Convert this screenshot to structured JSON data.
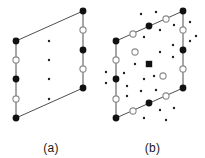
{
  "figure": {
    "type": "lattice-diagram",
    "background_color": "#ffffff",
    "line_color": "#3a3a3a",
    "filled_marker_color": "#111111",
    "open_marker_stroke": "#8a8a8a",
    "small_dot_color": "#222222",
    "width": 205,
    "height": 158
  },
  "panels": [
    {
      "id": "a",
      "caption": "(a)",
      "cell": {
        "corners": [
          {
            "x": 16,
            "y": 118,
            "marker": "filled-circle"
          },
          {
            "x": 16,
            "y": 41,
            "marker": "filled-circle"
          },
          {
            "x": 83,
            "y": 11,
            "marker": "filled-circle"
          },
          {
            "x": 83,
            "y": 88,
            "marker": "filled-circle"
          }
        ]
      },
      "markers": [
        {
          "x": 16,
          "y": 41,
          "type": "filled-circle",
          "r": 3.4
        },
        {
          "x": 16,
          "y": 60,
          "type": "open-circle",
          "r": 3.1
        },
        {
          "x": 16,
          "y": 79,
          "type": "filled-circle",
          "r": 3.4
        },
        {
          "x": 16,
          "y": 99,
          "type": "open-circle",
          "r": 3.1
        },
        {
          "x": 16,
          "y": 118,
          "type": "filled-circle",
          "r": 3.4
        },
        {
          "x": 83,
          "y": 11,
          "type": "filled-circle",
          "r": 3.4
        },
        {
          "x": 83,
          "y": 30,
          "type": "open-circle",
          "r": 3.1
        },
        {
          "x": 83,
          "y": 50,
          "type": "filled-circle",
          "r": 3.4
        },
        {
          "x": 83,
          "y": 69,
          "type": "open-circle",
          "r": 3.1
        },
        {
          "x": 83,
          "y": 88,
          "type": "filled-circle",
          "r": 3.4
        },
        {
          "x": 49,
          "y": 41,
          "type": "small-dot",
          "r": 1.2
        },
        {
          "x": 49,
          "y": 60,
          "type": "small-dot",
          "r": 1.2
        },
        {
          "x": 49,
          "y": 79,
          "type": "small-dot",
          "r": 1.2
        },
        {
          "x": 49,
          "y": 99,
          "type": "small-dot",
          "r": 1.2
        }
      ]
    },
    {
      "id": "b",
      "caption": "(b)",
      "cell": {
        "corners": [
          {
            "x": 16,
            "y": 118,
            "marker": "filled-circle"
          },
          {
            "x": 16,
            "y": 41,
            "marker": "filled-circle"
          },
          {
            "x": 83,
            "y": 11,
            "marker": "filled-circle"
          },
          {
            "x": 83,
            "y": 88,
            "marker": "filled-circle"
          }
        ]
      },
      "markers": [
        {
          "x": 16,
          "y": 41,
          "type": "filled-circle",
          "r": 3.4
        },
        {
          "x": 16,
          "y": 60,
          "type": "open-circle",
          "r": 3.1
        },
        {
          "x": 16,
          "y": 79,
          "type": "filled-circle",
          "r": 3.4
        },
        {
          "x": 16,
          "y": 99,
          "type": "open-circle",
          "r": 3.1
        },
        {
          "x": 16,
          "y": 118,
          "type": "filled-circle",
          "r": 3.4
        },
        {
          "x": 83,
          "y": 11,
          "type": "filled-circle",
          "r": 3.4
        },
        {
          "x": 83,
          "y": 30,
          "type": "open-circle",
          "r": 3.1
        },
        {
          "x": 83,
          "y": 50,
          "type": "filled-circle",
          "r": 3.4
        },
        {
          "x": 83,
          "y": 69,
          "type": "open-circle",
          "r": 3.1
        },
        {
          "x": 83,
          "y": 88,
          "type": "filled-circle",
          "r": 3.4
        },
        {
          "x": 33,
          "y": 34,
          "type": "open-circle",
          "r": 3.1
        },
        {
          "x": 49,
          "y": 26,
          "type": "filled-circle",
          "r": 3.4
        },
        {
          "x": 66,
          "y": 19,
          "type": "open-circle",
          "r": 3.1
        },
        {
          "x": 33,
          "y": 111,
          "type": "open-circle",
          "r": 3.1
        },
        {
          "x": 49,
          "y": 103,
          "type": "filled-circle",
          "r": 3.4
        },
        {
          "x": 66,
          "y": 96,
          "type": "open-circle",
          "r": 3.1
        },
        {
          "x": 49,
          "y": 64,
          "type": "filled-square",
          "r": 3.2
        },
        {
          "x": 35,
          "y": 52,
          "type": "open-circle",
          "r": 3.1
        },
        {
          "x": 63,
          "y": 76,
          "type": "open-circle",
          "r": 3.1
        },
        {
          "x": 41,
          "y": 14,
          "type": "small-dot",
          "r": 1.2
        },
        {
          "x": 56,
          "y": 12,
          "type": "small-dot",
          "r": 1.2
        },
        {
          "x": 60,
          "y": 30,
          "type": "small-dot",
          "r": 1.2
        },
        {
          "x": 44,
          "y": 37,
          "type": "small-dot",
          "r": 1.2
        },
        {
          "x": 74,
          "y": 25,
          "type": "small-dot",
          "r": 1.2
        },
        {
          "x": 90,
          "y": 22,
          "type": "small-dot",
          "r": 1.2
        },
        {
          "x": 90,
          "y": 41,
          "type": "small-dot",
          "r": 1.2
        },
        {
          "x": 96,
          "y": 36,
          "type": "small-dot",
          "r": 1.2
        },
        {
          "x": 73,
          "y": 45,
          "type": "small-dot",
          "r": 1.2
        },
        {
          "x": 73,
          "y": 57,
          "type": "small-dot",
          "r": 1.2
        },
        {
          "x": 60,
          "y": 52,
          "type": "small-dot",
          "r": 1.2
        },
        {
          "x": 44,
          "y": 79,
          "type": "small-dot",
          "r": 1.2
        },
        {
          "x": 54,
          "y": 76,
          "type": "small-dot",
          "r": 1.2
        },
        {
          "x": 35,
          "y": 64,
          "type": "small-dot",
          "r": 1.2
        },
        {
          "x": 24,
          "y": 73,
          "type": "small-dot",
          "r": 1.2
        },
        {
          "x": 6,
          "y": 72,
          "type": "small-dot",
          "r": 1.2
        },
        {
          "x": 6,
          "y": 83,
          "type": "small-dot",
          "r": 1.2
        },
        {
          "x": 27,
          "y": 86,
          "type": "small-dot",
          "r": 1.2
        },
        {
          "x": 27,
          "y": 96,
          "type": "small-dot",
          "r": 1.2
        },
        {
          "x": 41,
          "y": 91,
          "type": "small-dot",
          "r": 1.2
        },
        {
          "x": 56,
          "y": 90,
          "type": "small-dot",
          "r": 1.2
        },
        {
          "x": 60,
          "y": 110,
          "type": "small-dot",
          "r": 1.2
        },
        {
          "x": 74,
          "y": 108,
          "type": "small-dot",
          "r": 1.2
        },
        {
          "x": 44,
          "y": 118,
          "type": "small-dot",
          "r": 1.2
        },
        {
          "x": 66,
          "y": 120,
          "type": "small-dot",
          "r": 1.2
        }
      ]
    }
  ]
}
